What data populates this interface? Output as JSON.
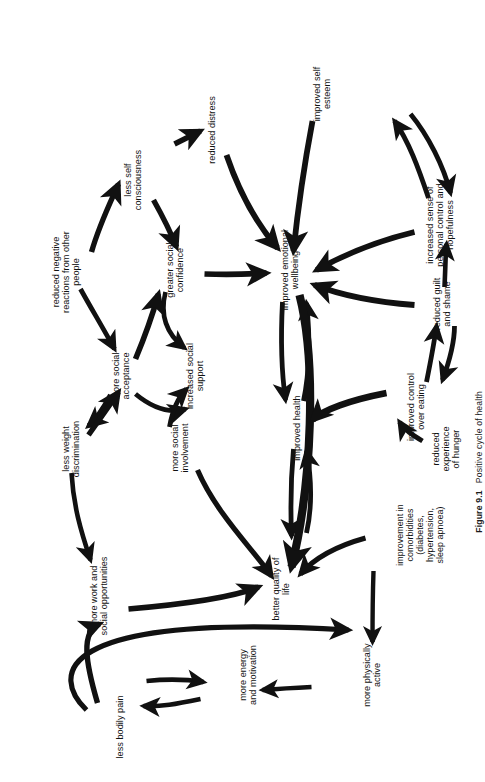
{
  "figure": {
    "caption_number": "Figure 9.1",
    "caption_text": "Positive cycle of health",
    "rotation_degrees": "-90",
    "background_color": "#ffffff",
    "ink_color": "#111111"
  },
  "diagram": {
    "type": "causal-loop-diagram",
    "node_count": 20,
    "nodes": [
      {
        "id": "more-physically-active",
        "label": "more physically\nactive",
        "x": 107,
        "y": 372
      },
      {
        "id": "more-energy-and-motivation",
        "label": "more energy\nand motivation",
        "x": 107,
        "y": 248
      },
      {
        "id": "less-bodily-pain",
        "label": "less bodily pain",
        "x": 55,
        "y": 120
      },
      {
        "id": "improvement-in-comorbidities",
        "label": "improvement in\ncomorbidities\n(diabetes,\nhypertension,\nsleep apnoea)",
        "x": 247,
        "y": 420
      },
      {
        "id": "better-quality-of-life",
        "label": "better quality of\nlife",
        "x": 193,
        "y": 281
      },
      {
        "id": "more-work-and-social-opportunities",
        "label": "more work and\nsocial opportunities",
        "x": 186,
        "y": 99
      },
      {
        "id": "reduced-experience-of-hunger",
        "label": "reduced\nexperience\nof hunger",
        "x": 333,
        "y": 446
      },
      {
        "id": "improved-control-over-eating",
        "label": "improved control\nover eating",
        "x": 375,
        "y": 416
      },
      {
        "id": "improved-health",
        "label": "improved health",
        "x": 354,
        "y": 297
      },
      {
        "id": "more-social-involvement",
        "label": "more social\ninvolvement",
        "x": 334,
        "y": 180
      },
      {
        "id": "less-weight-discrimination",
        "label": "less weight\ndiscrimination",
        "x": 333,
        "y": 71
      },
      {
        "id": "increased-social-support",
        "label": "increased social\nsupport",
        "x": 406,
        "y": 195
      },
      {
        "id": "more-social-acceptance",
        "label": "more social\nacceptance",
        "x": 406,
        "y": 121
      },
      {
        "id": "reduced-guilt-and-shame",
        "label": "reduced guilt\nand shame",
        "x": 478,
        "y": 442
      },
      {
        "id": "improved-emotional-wellbeing",
        "label": "improved emotional\nwellbeing",
        "x": 512,
        "y": 290
      },
      {
        "id": "greater-social-confidence",
        "label": "greater social\nconfidence",
        "x": 512,
        "y": 175
      },
      {
        "id": "reduced-negative-reactions",
        "label": "reduced negative\nreactions from other\npeople",
        "x": 510,
        "y": 66
      },
      {
        "id": "increased-sense-personal-control",
        "label": "increased sense of\npersonal control and\nhopefulness",
        "x": 557,
        "y": 440
      },
      {
        "id": "less-self-consciousness",
        "label": "less self\nconsciousness",
        "x": 602,
        "y": 133
      },
      {
        "id": "reduced-distress",
        "label": "reduced distress",
        "x": 652,
        "y": 212
      },
      {
        "id": "improved-self-esteem",
        "label": "improved self\nesteem",
        "x": 688,
        "y": 322
      }
    ],
    "edges": [
      {
        "from": "less-bodily-pain",
        "to": "more-physically-active",
        "weight": "thick"
      },
      {
        "from": "more-physically-active",
        "to": "more-energy-and-motivation",
        "weight": "medium"
      },
      {
        "from": "more-energy-and-motivation",
        "to": "less-bodily-pain",
        "weight": "medium",
        "bidirectional": "true"
      },
      {
        "from": "less-bodily-pain",
        "to": "more-work-and-social-opportunities",
        "weight": "thick"
      },
      {
        "from": "improvement-in-comorbidities",
        "to": "more-physically-active",
        "weight": "medium"
      },
      {
        "from": "improvement-in-comorbidities",
        "to": "better-quality-of-life",
        "weight": "thick"
      },
      {
        "from": "more-work-and-social-opportunities",
        "to": "better-quality-of-life",
        "weight": "thick"
      },
      {
        "from": "less-weight-discrimination",
        "to": "more-work-and-social-opportunities",
        "weight": "medium"
      },
      {
        "from": "reduced-experience-of-hunger",
        "to": "improved-control-over-eating",
        "weight": "medium"
      },
      {
        "from": "improved-control-over-eating",
        "to": "reduced-guilt-and-shame",
        "weight": "medium",
        "bidirectional": "true"
      },
      {
        "from": "improved-health",
        "to": "better-quality-of-life",
        "weight": "medium",
        "bidirectional": "true"
      },
      {
        "from": "improved-emotional-wellbeing",
        "to": "improved-health",
        "weight": "medium",
        "bidirectional": "true"
      },
      {
        "from": "improved-emotional-wellbeing",
        "to": "better-quality-of-life",
        "weight": "very-thick"
      },
      {
        "from": "improved-control-over-eating",
        "to": "improved-health",
        "weight": "thick"
      },
      {
        "from": "reduced-guilt-and-shame",
        "to": "improved-emotional-wellbeing",
        "weight": "thick"
      },
      {
        "from": "reduced-guilt-and-shame",
        "to": "increased-sense-personal-control",
        "weight": "medium"
      },
      {
        "from": "increased-sense-personal-control",
        "to": "improved-emotional-wellbeing",
        "weight": "thick"
      },
      {
        "from": "increased-sense-personal-control",
        "to": "improved-self-esteem",
        "weight": "medium",
        "bidirectional": "true"
      },
      {
        "from": "improved-self-esteem",
        "to": "improved-emotional-wellbeing",
        "weight": "thick"
      },
      {
        "from": "reduced-distress",
        "to": "improved-emotional-wellbeing",
        "weight": "thick"
      },
      {
        "from": "less-self-consciousness",
        "to": "reduced-distress",
        "weight": "thick"
      },
      {
        "from": "less-self-consciousness",
        "to": "greater-social-confidence",
        "weight": "thick"
      },
      {
        "from": "greater-social-confidence",
        "to": "improved-emotional-wellbeing",
        "weight": "thick"
      },
      {
        "from": "greater-social-confidence",
        "to": "increased-social-support",
        "weight": "medium"
      },
      {
        "from": "reduced-negative-reactions",
        "to": "less-self-consciousness",
        "weight": "thick"
      },
      {
        "from": "reduced-negative-reactions",
        "to": "more-social-acceptance",
        "weight": "medium"
      },
      {
        "from": "more-social-acceptance",
        "to": "increased-social-support",
        "weight": "medium"
      },
      {
        "from": "more-social-acceptance",
        "to": "greater-social-confidence",
        "weight": "thick"
      },
      {
        "from": "more-social-acceptance",
        "to": "more-social-involvement",
        "weight": "medium"
      },
      {
        "from": "less-weight-discrimination",
        "to": "more-social-acceptance",
        "weight": "thick"
      },
      {
        "from": "more-social-involvement",
        "to": "increased-social-support",
        "weight": "medium"
      },
      {
        "from": "more-social-involvement",
        "to": "better-quality-of-life",
        "weight": "medium"
      }
    ]
  }
}
